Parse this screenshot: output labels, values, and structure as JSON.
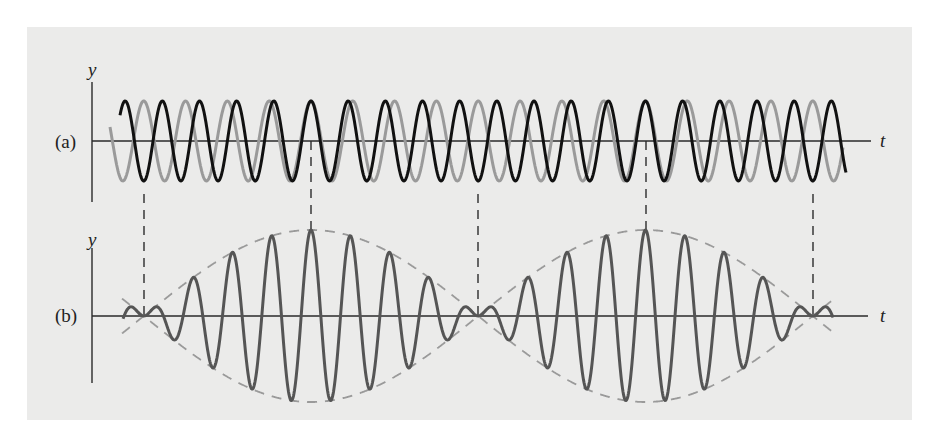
{
  "figure": {
    "panel_a_label": "(a)",
    "panel_b_label": "(b)",
    "y_axis_label_a": "y",
    "y_axis_label_b": "y",
    "t_axis_label_a": "t",
    "t_axis_label_b": "t"
  },
  "colors": {
    "background": "#ebebea",
    "axis": "#2a2a2a",
    "wave_black": "#111111",
    "wave_gray": "#9a9a9a",
    "sum_wave": "#555555",
    "envelope": "#9a9a9a",
    "guide_dash": "#444444"
  },
  "chart_data": {
    "type": "line",
    "panels": [
      {
        "id": "a",
        "label": "(a)",
        "xlabel": "t",
        "ylabel": "y",
        "series": [
          {
            "name": "wave 1 (higher frequency)",
            "color": "black",
            "cycles_per_beat": 9,
            "amplitude": 1
          },
          {
            "name": "wave 2 (lower frequency)",
            "color": "gray",
            "cycles_per_beat": 8,
            "amplitude": 1
          }
        ]
      },
      {
        "id": "b",
        "label": "(b)",
        "xlabel": "t",
        "ylabel": "y",
        "series": [
          {
            "name": "resultant (sum)",
            "amplitude_max": 2,
            "beats_shown": 2
          },
          {
            "name": "envelope",
            "style": "dashed"
          }
        ]
      }
    ],
    "guide_lines": [
      {
        "x_px": 144,
        "meaning": "node (waves out of phase)"
      },
      {
        "x_px": 311,
        "meaning": "antinode (waves in phase)"
      },
      {
        "x_px": 478,
        "meaning": "node (waves out of phase)"
      },
      {
        "x_px": 646,
        "meaning": "antinode (waves in phase)"
      },
      {
        "x_px": 813,
        "meaning": "node (waves out of phase)"
      }
    ],
    "grid": false,
    "legend": "none"
  }
}
